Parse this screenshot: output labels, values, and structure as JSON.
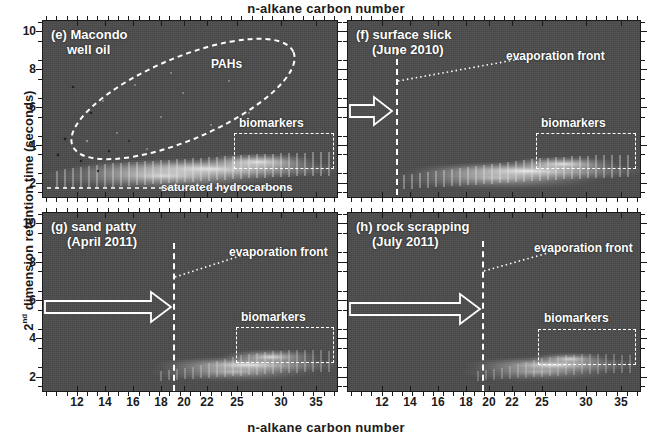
{
  "figure": {
    "top_axis_title": "n-alkane  carbon  number",
    "bottom_axis_title": "n-alkane  carbon  number",
    "y_axis_title_prefix": "2",
    "y_axis_title_sup": "nd",
    "y_axis_title_rest": " dimension  retention  time  (seconds)",
    "background_color": "#4c4c4c",
    "annotation_color": "#ffffff"
  },
  "axes": {
    "x_ticks": [
      {
        "label": "12",
        "x": 77
      },
      {
        "label": "14",
        "x": 105
      },
      {
        "label": "16",
        "x": 133
      },
      {
        "label": "18",
        "x": 161
      },
      {
        "label": "20",
        "x": 184
      },
      {
        "label": "22",
        "x": 207
      },
      {
        "label": "25",
        "x": 237
      },
      {
        "label": "30",
        "x": 281
      },
      {
        "label": "35",
        "x": 316
      }
    ],
    "y_ticks": [
      "10",
      "8",
      "6",
      "4",
      "2"
    ],
    "y_values": [
      10,
      8,
      6,
      4,
      2
    ],
    "y_range": [
      1.2,
      10.6
    ],
    "x_range_carbon": [
      9,
      38
    ]
  },
  "panels": [
    {
      "id": "e",
      "tag": "(e) Macondo",
      "tag_line2": "well oil",
      "annotations": {
        "pahs": "PAHs",
        "biomarkers": "biomarkers",
        "saturated": "saturated hydrocarbons"
      },
      "has_ellipse": true,
      "has_evaporation_front": false,
      "has_arrow": false
    },
    {
      "id": "f",
      "tag": "(f) surface slick",
      "tag_line2": "(June 2010)",
      "annotations": {
        "evaporation_front": "evaporation front",
        "biomarkers": "biomarkers"
      },
      "evaporation_front_carbon": 12,
      "has_evaporation_front": true,
      "has_arrow": true,
      "arrow_length": "short"
    },
    {
      "id": "g",
      "tag": "(g) sand patty",
      "tag_line2": "(April 2011)",
      "annotations": {
        "evaporation_front": "evaporation front",
        "biomarkers": "biomarkers"
      },
      "evaporation_front_carbon": 17,
      "has_evaporation_front": true,
      "has_arrow": true,
      "arrow_length": "long"
    },
    {
      "id": "h",
      "tag": "(h) rock scrapping",
      "tag_line2": "(July 2011)",
      "annotations": {
        "evaporation_front": "evaporation front",
        "biomarkers": "biomarkers"
      },
      "evaporation_front_carbon": 19,
      "has_evaporation_front": true,
      "has_arrow": true,
      "arrow_length": "long"
    }
  ],
  "chart_data": {
    "type": "heatmap",
    "xlabel": "n-alkane  carbon  number",
    "ylabel": "2nd dimension  retention  time  (seconds)",
    "ylim": [
      1.2,
      10.6
    ],
    "xlim_carbon_number": [
      9,
      38
    ],
    "xtick_labels": [
      "12",
      "14",
      "16",
      "18",
      "20",
      "22",
      "25",
      "30",
      "35"
    ],
    "ytick_labels": [
      "2",
      "4",
      "6",
      "8",
      "10"
    ],
    "grid": false,
    "legend": "none",
    "colormap": "grayscale (dark background, bright signal)",
    "panels": [
      {
        "key": "e",
        "label": "(e) Macondo well oil",
        "signal_onset_carbon": 9,
        "evaporation_front_carbon": null,
        "regions": [
          {
            "name": "PAHs",
            "shape": "ellipse",
            "x_carbon_range": [
              10,
              32
            ],
            "y_seconds_range": [
              3.6,
              10.2
            ]
          },
          {
            "name": "biomarkers",
            "shape": "rect",
            "x_carbon_range": [
              25,
              37
            ],
            "y_seconds_range": [
              3.4,
              5.1
            ]
          },
          {
            "name": "saturated hydrocarbons",
            "shape": "band",
            "x_carbon_range": [
              9,
              38
            ],
            "y_seconds_range": [
              1.8,
              3.2
            ]
          }
        ]
      },
      {
        "key": "f",
        "label": "(f) surface slick (June 2010)",
        "signal_onset_carbon": 12,
        "evaporation_front_carbon": 12,
        "regions": [
          {
            "name": "biomarkers",
            "shape": "rect",
            "x_carbon_range": [
              25,
              37
            ],
            "y_seconds_range": [
              3.4,
              5.1
            ]
          }
        ]
      },
      {
        "key": "g",
        "label": "(g) sand patty (April 2011)",
        "signal_onset_carbon": 17,
        "evaporation_front_carbon": 17,
        "regions": [
          {
            "name": "biomarkers",
            "shape": "rect",
            "x_carbon_range": [
              25,
              37
            ],
            "y_seconds_range": [
              3.4,
              5.1
            ]
          }
        ]
      },
      {
        "key": "h",
        "label": "(h) rock scrapping (July 2011)",
        "signal_onset_carbon": 19,
        "evaporation_front_carbon": 19,
        "regions": [
          {
            "name": "biomarkers",
            "shape": "rect",
            "x_carbon_range": [
              26,
              37
            ],
            "y_seconds_range": [
              3.4,
              5.1
            ]
          }
        ]
      }
    ]
  }
}
